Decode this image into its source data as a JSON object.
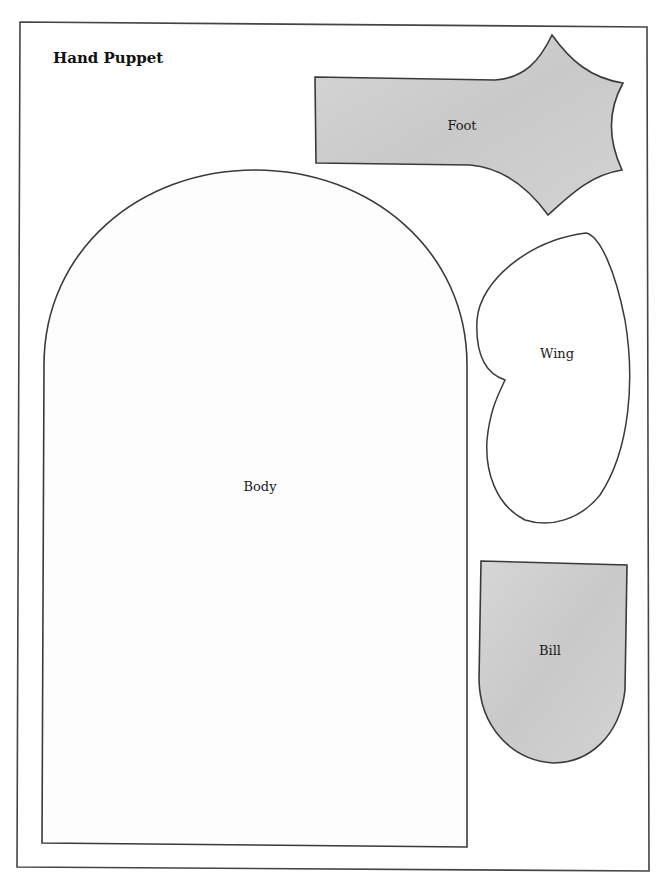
{
  "title": "Hand Puppet",
  "pieces": {
    "foot": {
      "label": "Foot",
      "fill": "#cfcfcf"
    },
    "wing": {
      "label": "Wing",
      "fill": "#ffffff"
    },
    "body": {
      "label": "Body",
      "fill": "#ffffff"
    },
    "bill": {
      "label": "Bill",
      "fill": "#cfcfcf"
    }
  },
  "colors": {
    "outline": "#3a3a3a",
    "frame": "#444444",
    "paper": "#ffffff"
  }
}
